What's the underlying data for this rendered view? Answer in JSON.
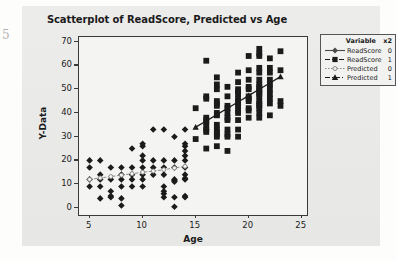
{
  "page": {
    "margin_glyph": "5"
  },
  "chart_data": {
    "type": "scatter",
    "title": "Scatterplot of ReadScore, Predicted vs Age",
    "xlabel": "Age",
    "ylabel": "Y-Data",
    "xlim": [
      4,
      25.5
    ],
    "ylim": [
      -3,
      72
    ],
    "xticks": [
      5,
      10,
      15,
      20,
      25
    ],
    "yticks": [
      0,
      10,
      20,
      30,
      40,
      50,
      60,
      70
    ],
    "grid": false,
    "legend_position": "right-outside",
    "legend": {
      "header_variable": "Variable",
      "header_group": "x2",
      "entries": [
        {
          "name": "ReadScore",
          "group": "0",
          "marker": "diamond",
          "line": "solid-gray",
          "color": "#4a4a4a"
        },
        {
          "name": "ReadScore",
          "group": "1",
          "marker": "square",
          "line": "dashed-dark",
          "color": "#1b1b1b"
        },
        {
          "name": "Predicted",
          "group": "0",
          "marker": "circle-open",
          "line": "dotted-gray",
          "color": "#8a8a8a"
        },
        {
          "name": "Predicted",
          "group": "1",
          "marker": "triangle",
          "line": "dashdot-dark",
          "color": "#1b1b1b"
        }
      ]
    },
    "series": [
      {
        "name": "ReadScore",
        "group": "0",
        "marker": "diamond",
        "color": "#1b1b1b",
        "points": [
          [
            5,
            20
          ],
          [
            5,
            17
          ],
          [
            5,
            12
          ],
          [
            5,
            9
          ],
          [
            6,
            20
          ],
          [
            6,
            14
          ],
          [
            6,
            12
          ],
          [
            6,
            9
          ],
          [
            6,
            4
          ],
          [
            7,
            17
          ],
          [
            7,
            12
          ],
          [
            7,
            7
          ],
          [
            7,
            5
          ],
          [
            7,
            4.5
          ],
          [
            8,
            17
          ],
          [
            8,
            14
          ],
          [
            8,
            12
          ],
          [
            8,
            9
          ],
          [
            8,
            4
          ],
          [
            8,
            1
          ],
          [
            9,
            25
          ],
          [
            9,
            17
          ],
          [
            9,
            14
          ],
          [
            9,
            12
          ],
          [
            9,
            9
          ],
          [
            10,
            27
          ],
          [
            10,
            26
          ],
          [
            10,
            22
          ],
          [
            10,
            20
          ],
          [
            10,
            17
          ],
          [
            10,
            14
          ],
          [
            10,
            12
          ],
          [
            10,
            9
          ],
          [
            11,
            33
          ],
          [
            11,
            20
          ],
          [
            11,
            17
          ],
          [
            11,
            14
          ],
          [
            12,
            33
          ],
          [
            12,
            20
          ],
          [
            12,
            17
          ],
          [
            12,
            14
          ],
          [
            12,
            9
          ],
          [
            12,
            7
          ],
          [
            12,
            6
          ],
          [
            12,
            4.5
          ],
          [
            13,
            30
          ],
          [
            13,
            20
          ],
          [
            13,
            17
          ],
          [
            13,
            12
          ],
          [
            13,
            11.5
          ],
          [
            13,
            11
          ],
          [
            13,
            4.5
          ],
          [
            13,
            0.5
          ],
          [
            14,
            33
          ],
          [
            14,
            27
          ],
          [
            14,
            26
          ],
          [
            14,
            24
          ],
          [
            14,
            22
          ],
          [
            14,
            20
          ],
          [
            14,
            17
          ],
          [
            14,
            14
          ],
          [
            14,
            12.5
          ],
          [
            14,
            12
          ],
          [
            14,
            5
          ],
          [
            14,
            4.5
          ]
        ]
      },
      {
        "name": "ReadScore",
        "group": "1",
        "marker": "square",
        "color": "#1b1b1b",
        "points": [
          [
            15,
            42
          ],
          [
            15,
            29
          ],
          [
            16,
            62
          ],
          [
            16,
            47
          ],
          [
            16,
            46
          ],
          [
            16,
            38
          ],
          [
            16,
            37
          ],
          [
            16,
            36
          ],
          [
            16,
            34
          ],
          [
            16,
            33
          ],
          [
            16,
            32
          ],
          [
            16,
            25
          ],
          [
            17,
            55
          ],
          [
            17,
            52
          ],
          [
            17,
            50
          ],
          [
            17,
            45
          ],
          [
            17,
            44
          ],
          [
            17,
            43
          ],
          [
            17,
            40
          ],
          [
            17,
            39
          ],
          [
            17,
            35
          ],
          [
            17,
            33
          ],
          [
            17,
            32
          ],
          [
            17,
            31
          ],
          [
            17,
            30
          ],
          [
            17,
            26
          ],
          [
            18,
            51
          ],
          [
            18,
            47
          ],
          [
            18,
            43
          ],
          [
            18,
            42
          ],
          [
            18,
            40
          ],
          [
            18,
            38
          ],
          [
            18,
            37
          ],
          [
            18,
            33
          ],
          [
            18,
            31
          ],
          [
            18,
            30
          ],
          [
            18,
            24
          ],
          [
            19,
            57
          ],
          [
            19,
            53
          ],
          [
            19,
            50
          ],
          [
            19,
            49
          ],
          [
            19,
            48
          ],
          [
            19,
            46
          ],
          [
            19,
            45
          ],
          [
            19,
            44
          ],
          [
            19,
            43
          ],
          [
            19,
            41
          ],
          [
            19,
            40
          ],
          [
            19,
            37
          ],
          [
            19,
            33
          ],
          [
            19,
            30
          ],
          [
            20,
            64
          ],
          [
            20,
            58
          ],
          [
            20,
            54
          ],
          [
            20,
            51
          ],
          [
            20,
            50
          ],
          [
            20,
            47
          ],
          [
            20,
            46
          ],
          [
            20,
            45
          ],
          [
            20,
            42
          ],
          [
            20,
            41
          ],
          [
            20,
            38
          ],
          [
            21,
            67
          ],
          [
            21,
            65
          ],
          [
            21,
            64
          ],
          [
            21,
            59
          ],
          [
            21,
            57
          ],
          [
            21,
            54
          ],
          [
            21,
            52
          ],
          [
            21,
            51
          ],
          [
            21,
            50
          ],
          [
            21,
            49
          ],
          [
            21,
            48
          ],
          [
            21,
            47
          ],
          [
            21,
            45
          ],
          [
            21,
            44
          ],
          [
            21,
            43
          ],
          [
            21,
            42
          ],
          [
            21,
            40
          ],
          [
            21,
            38
          ],
          [
            22,
            63
          ],
          [
            22,
            59
          ],
          [
            22,
            57
          ],
          [
            22,
            54
          ],
          [
            22,
            52
          ],
          [
            22,
            50
          ],
          [
            22,
            48
          ],
          [
            22,
            46
          ],
          [
            22,
            44
          ],
          [
            22,
            39
          ],
          [
            23,
            66
          ],
          [
            23,
            58
          ],
          [
            23,
            45
          ],
          [
            23,
            43
          ]
        ]
      },
      {
        "name": "Predicted",
        "group": "0",
        "marker": "circle-open",
        "color": "#8a8a8a",
        "line": true,
        "points": [
          [
            5,
            12
          ],
          [
            6,
            12.6
          ],
          [
            7,
            13.2
          ],
          [
            8,
            13.8
          ],
          [
            9,
            14.4
          ],
          [
            10,
            15
          ],
          [
            11,
            15.5
          ],
          [
            12,
            16.1
          ],
          [
            13,
            16.8
          ],
          [
            14,
            17.5
          ]
        ]
      },
      {
        "name": "Predicted",
        "group": "1",
        "marker": "triangle",
        "color": "#1b1b1b",
        "line": true,
        "points": [
          [
            15,
            34
          ],
          [
            16,
            36.6
          ],
          [
            17,
            39.3
          ],
          [
            18,
            42
          ],
          [
            19,
            44.6
          ],
          [
            20,
            47.3
          ],
          [
            21,
            50
          ],
          [
            22,
            52.6
          ],
          [
            23,
            55.3
          ]
        ]
      }
    ]
  }
}
